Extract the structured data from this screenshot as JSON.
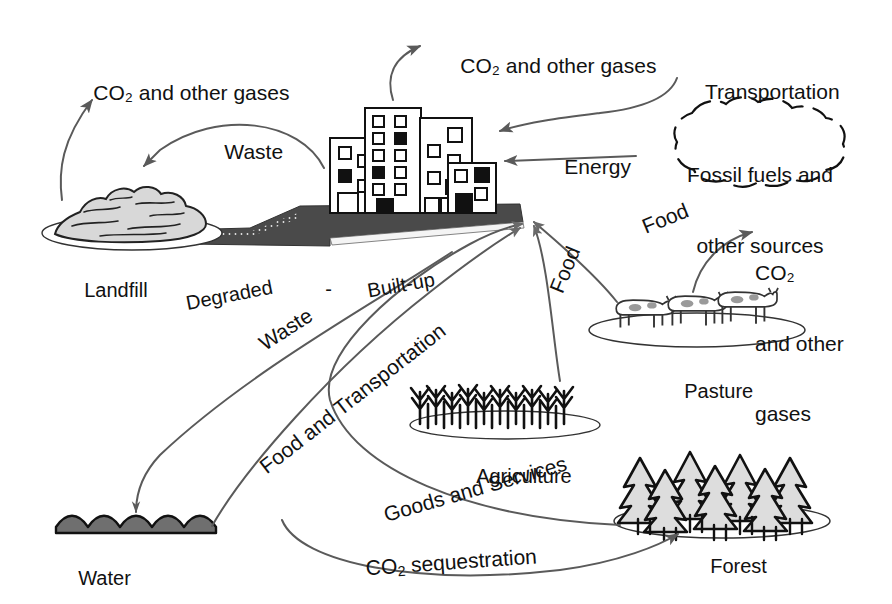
{
  "figure": {
    "type": "diagram",
    "background_color": "#ffffff",
    "line_color": "#5a5a5a",
    "ink_color": "#111111",
    "fill_gray": "#d0d0d0",
    "road_gray": "#4a4a4a"
  },
  "nodes": [
    {
      "id": "landfill",
      "label": "Landfill",
      "icon": "landfill-mound-icon"
    },
    {
      "id": "built_up",
      "label": "Built-up",
      "icon": "city-buildings-icon"
    },
    {
      "id": "degraded",
      "label": "Degraded",
      "icon": "degraded-road-icon"
    },
    {
      "id": "water",
      "label": "Water",
      "icon": "water-waves-icon"
    },
    {
      "id": "agriculture",
      "label": "Agriculture",
      "icon": "crop-field-icon"
    },
    {
      "id": "pasture",
      "label": "Pasture",
      "icon": "cattle-pasture-icon"
    },
    {
      "id": "forest",
      "label": "Forest",
      "icon": "conifer-forest-icon"
    },
    {
      "id": "fossil_fuels",
      "label": "Fossil fuels and\nother sources",
      "icon": "cloud-blob-icon"
    }
  ],
  "emissions": [
    {
      "id": "emit_landfill",
      "label": "CO₂ and other gases",
      "from": "landfill"
    },
    {
      "id": "emit_city",
      "label": "CO₂ and other gases",
      "from": "built_up"
    },
    {
      "id": "emit_pasture",
      "label": "CO₂\nand other\ngases",
      "from": "pasture"
    }
  ],
  "flows": [
    {
      "id": "flow_waste_top",
      "label": "Waste",
      "from": "built_up",
      "to": "landfill"
    },
    {
      "id": "flow_transportation",
      "label": "Transportation",
      "from": "external",
      "to": "built_up"
    },
    {
      "id": "flow_energy",
      "label": "Energy",
      "from": "fossil_fuels",
      "to": "built_up"
    },
    {
      "id": "flow_food_pasture",
      "label": "Food",
      "from": "pasture",
      "to": "built_up"
    },
    {
      "id": "flow_food_agri",
      "label": "Food",
      "from": "agriculture",
      "to": "built_up"
    },
    {
      "id": "flow_waste_water",
      "label": "Waste",
      "from": "built_up",
      "to": "water"
    },
    {
      "id": "flow_food_transport",
      "label": "Food and Transportation",
      "from": "water",
      "to": "built_up"
    },
    {
      "id": "flow_goods",
      "label": "Goods and Services",
      "from": "forest",
      "to": "built_up"
    },
    {
      "id": "flow_sequestration",
      "label": "CO₂ sequestration",
      "from": "built_up",
      "to": "forest"
    }
  ],
  "labels": {
    "emit_landfill": "CO₂ and other gases",
    "emit_city": "CO₂ and other gases",
    "emit_pasture_l1": "CO₂",
    "emit_pasture_l2": "and other",
    "emit_pasture_l3": "gases",
    "waste_top": "Waste",
    "transportation": "Transportation",
    "energy": "Energy",
    "fossil_l1": "Fossil fuels and",
    "fossil_l2": "other sources",
    "food_pasture": "Food",
    "food_agri": "Food",
    "waste_water": "Waste",
    "food_and_transportation": "Food and Transportation",
    "goods_and_services": "Goods and Services",
    "co2_sequestration_pre": "CO",
    "co2_sequestration_sub": "2",
    "co2_sequestration_post": " sequestration",
    "landfill": "Landfill",
    "degraded": "Degraded",
    "dash": "-",
    "built_up": "Built-up",
    "water": "Water",
    "agriculture": "Agriculture",
    "pasture": "Pasture",
    "forest": "Forest"
  }
}
